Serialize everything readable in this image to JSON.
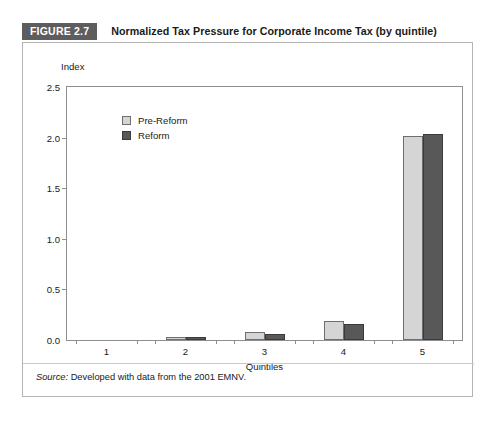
{
  "figure": {
    "badge": "FIGURE 2.7",
    "title": "Normalized Tax Pressure for Corporate Income Tax (by quintile)",
    "source_label": "Source:",
    "source_text": " Developed with data from the 2001 EMNV."
  },
  "colors": {
    "badge_bg": "#5d5d5d",
    "badge_text": "#ffffff",
    "pre_reform": "#d5d5d5",
    "pre_reform_border": "#6e6e6e",
    "reform": "#585858",
    "reform_border": "#3a3a3a",
    "frame_border": "#b4b4b4",
    "axis": "#8e8e8e",
    "text": "#1a1a1a"
  },
  "chart_data": {
    "type": "bar",
    "title": "Normalized Tax Pressure for Corporate Income Tax (by quintile)",
    "xlabel": "Quintiles",
    "ylabel": "Index",
    "categories": [
      "1",
      "2",
      "3",
      "4",
      "5"
    ],
    "series": [
      {
        "name": "Pre-Reform",
        "values": [
          0.0,
          0.025,
          0.075,
          0.19,
          2.02
        ]
      },
      {
        "name": "Reform",
        "values": [
          0.0,
          0.03,
          0.06,
          0.16,
          2.04
        ]
      }
    ],
    "ylim": [
      0.0,
      2.5
    ],
    "ytick_labels": [
      "0.0",
      "0.5",
      "1.0",
      "1.5",
      "2.0",
      "2.5"
    ],
    "ytick_values": [
      0.0,
      0.5,
      1.0,
      1.5,
      2.0,
      2.5
    ],
    "grid": false,
    "legend_position": "upper left inside"
  }
}
